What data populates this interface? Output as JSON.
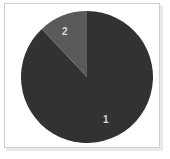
{
  "chart_data": {
    "type": "pie",
    "title": "",
    "categories": [
      "1",
      "2"
    ],
    "values": [
      88,
      12
    ],
    "labels": [
      "1",
      "2"
    ],
    "colors": [
      "#323232",
      "#5a5a5a"
    ],
    "start_angle_deg": 0,
    "direction": "counterclockwise",
    "legend": "none",
    "grid": false,
    "series": [
      {
        "name": "Series 1",
        "values": [
          88,
          12
        ]
      }
    ],
    "slices": [
      {
        "label": "1",
        "value": 88,
        "percent": 88,
        "color": "#323232",
        "angle_deg": 316
      },
      {
        "label": "2",
        "value": 12,
        "percent": 12,
        "color": "#5a5a5a",
        "angle_deg": 44
      }
    ]
  },
  "figure": {
    "background": "#ffffff",
    "border_color": "#cfcfcf",
    "label_color": "#d8d8d8",
    "center_x": 87,
    "center_y": 77,
    "radius": 66
  },
  "labels": {
    "slice_one": "1",
    "slice_two": "2"
  }
}
